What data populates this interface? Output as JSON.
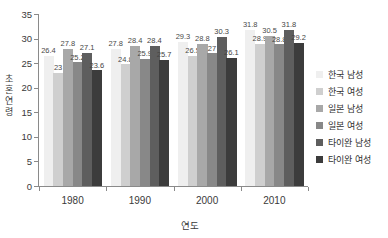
{
  "chart_data": {
    "type": "bar",
    "title": "",
    "xlabel": "연도",
    "ylabel": "초혼연령",
    "categories": [
      "1980",
      "1990",
      "2000",
      "2010"
    ],
    "ylim": [
      0,
      35
    ],
    "yticks": [
      0,
      5,
      10,
      15,
      20,
      25,
      30,
      35
    ],
    "ytick_labels": [
      "0",
      "5",
      "10",
      "15",
      "20",
      "25",
      "30",
      "35"
    ],
    "grid": false,
    "legend_position": "right",
    "series": [
      {
        "name": "한국 남성",
        "color": "#efefef",
        "values": [
          26.4,
          27.8,
          29.3,
          31.8
        ],
        "labels": [
          "26.4",
          "27.8",
          "29.3",
          "31.8"
        ]
      },
      {
        "name": "한국 여성",
        "color": "#cfcfcf",
        "values": [
          23,
          24.8,
          26.5,
          28.9
        ],
        "labels": [
          "23",
          "24.8",
          "26.5",
          "28.9"
        ]
      },
      {
        "name": "일본 남성",
        "color": "#a8a8a8",
        "values": [
          27.8,
          28.4,
          28.8,
          30.5
        ],
        "labels": [
          "27.8",
          "28.4",
          "28.8",
          "30.5"
        ]
      },
      {
        "name": "일본 여성",
        "color": "#888888",
        "values": [
          25.2,
          25.9,
          27,
          28.8
        ],
        "labels": [
          "25.2",
          "25.9",
          "27",
          "28.8"
        ]
      },
      {
        "name": "타이완 남성",
        "color": "#5e5e5e",
        "values": [
          27.1,
          28.4,
          30.3,
          31.8
        ],
        "labels": [
          "27.1",
          "28.4",
          "30.3",
          "31.8"
        ]
      },
      {
        "name": "타이완 여성",
        "color": "#3c3c3c",
        "values": [
          23.6,
          25.7,
          26.1,
          29.2
        ],
        "labels": [
          "23.6",
          "25.7",
          "26.1",
          "29.2"
        ]
      }
    ]
  },
  "y_axis_title_chars": [
    "초",
    "혼",
    "연",
    "령"
  ]
}
